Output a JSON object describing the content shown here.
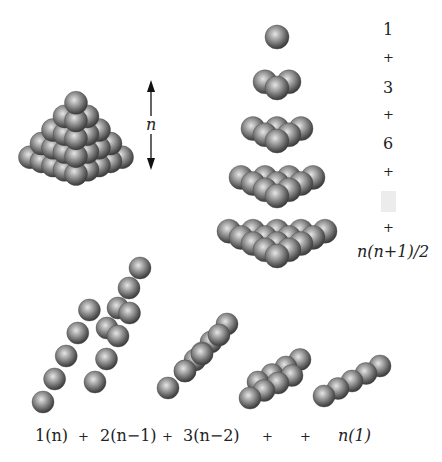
{
  "figure": {
    "pyramid": {
      "height_label": "n",
      "layers": 5
    },
    "layer_stack": {
      "layers": [
        1,
        2,
        3,
        4,
        5
      ],
      "sum_terms": [
        "1",
        "+",
        "3",
        "+",
        "6",
        "+",
        "",
        "+",
        "n(n+1)/2"
      ]
    },
    "diagonal_slices": {
      "count": 5,
      "sum_terms": [
        "1(n)",
        "+",
        "2(n−1)",
        "+",
        "3(n−2)",
        "+",
        "+",
        "n(1)"
      ]
    },
    "colors": {
      "sphere_light": "#d8d8d8",
      "sphere_mid": "#8a8a8a",
      "sphere_dark": "#3a3a3a",
      "text": "#222222",
      "placeholder_box": "#ececec"
    }
  }
}
